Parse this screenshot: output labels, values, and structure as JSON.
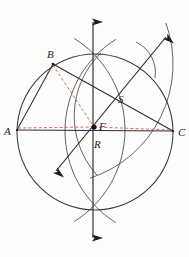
{
  "figure": {
    "type": "geometric-construction",
    "canvas": {
      "width": 189,
      "height": 257
    },
    "background_color": "#fdfdfc",
    "stroke_color": "#3a3a3a",
    "construction_color": "#d4555f",
    "point_color": "#111111"
  },
  "labels": {
    "a": "A",
    "b": "B",
    "c": "C",
    "f": "F",
    "r": "R",
    "s": "S"
  },
  "points": {
    "a": {
      "name": "A",
      "x": 17,
      "y": 130
    },
    "b": {
      "name": "B",
      "x": 53,
      "y": 64
    },
    "c": {
      "name": "C",
      "x": 173,
      "y": 131
    },
    "f": {
      "name": "F",
      "x": 94,
      "y": 127
    },
    "r": {
      "name": "R",
      "x": 96,
      "y": 135
    },
    "s": {
      "name": "S",
      "x": 120,
      "y": 104
    }
  },
  "label_positions": {
    "a": {
      "x": 4,
      "y": 135
    },
    "b": {
      "x": 47,
      "y": 58
    },
    "c": {
      "x": 178,
      "y": 136
    },
    "f": {
      "x": 99,
      "y": 129
    },
    "r": {
      "x": 96,
      "y": 147
    },
    "s": {
      "x": 119,
      "y": 102
    }
  },
  "circumcircle": {
    "name": "circumscribed-circle",
    "cx": 95,
    "cy": 132,
    "r": 78
  },
  "arcs": [
    {
      "name": "arc-from-a",
      "cx": 17,
      "cy": 130,
      "r": 108,
      "start_deg": -58,
      "end_deg": 58
    },
    {
      "name": "arc-from-c",
      "cx": 173,
      "cy": 131,
      "r": 108,
      "start_deg": 122,
      "end_deg": 238
    },
    {
      "name": "arc-from-b-lower",
      "cx": 53,
      "cy": 64,
      "r": 120,
      "start_deg": -20,
      "end_deg": 72
    },
    {
      "name": "arc-from-c-short",
      "cx": 173,
      "cy": 131,
      "r": 88,
      "start_deg": 150,
      "end_deg": 215
    }
  ],
  "lines": {
    "side_ab": {
      "name": "segment-AB",
      "x1": 17,
      "y1": 130,
      "x2": 53,
      "y2": 64
    },
    "side_ac": {
      "name": "segment-AC",
      "x1": 17,
      "y1": 130,
      "x2": 173,
      "y2": 131
    },
    "side_bc": {
      "name": "segment-BC",
      "x1": 53,
      "y1": 64,
      "x2": 173,
      "y2": 131
    },
    "perp_bisector_vertical": {
      "name": "vertical-perpendicular-bisector",
      "x1": 93,
      "y1": 17,
      "x2": 93,
      "y2": 243
    },
    "perp_bisector_diagonal": {
      "name": "diagonal-perpendicular-bisector",
      "x1": 170,
      "y1": 33,
      "x2": 52,
      "y2": 176
    }
  },
  "dashed_lines": [
    {
      "name": "dashed-A-to-F",
      "x1": 18,
      "y1": 128,
      "x2": 94,
      "y2": 127
    },
    {
      "name": "dashed-F-to-C",
      "x1": 94,
      "y1": 127,
      "x2": 172,
      "y2": 130
    },
    {
      "name": "dashed-B-to-F",
      "x1": 53,
      "y1": 65,
      "x2": 94,
      "y2": 127
    }
  ],
  "arrows": [
    {
      "name": "arrow-up",
      "x": 93,
      "y": 17,
      "direction": "up"
    },
    {
      "name": "arrow-down",
      "x": 93,
      "y": 243,
      "direction": "down"
    },
    {
      "name": "arrow-upper-right",
      "x": 170,
      "y": 33,
      "direction": "upper-right"
    },
    {
      "name": "arrow-lower-left",
      "x": 52,
      "y": 176,
      "direction": "lower-left"
    }
  ]
}
